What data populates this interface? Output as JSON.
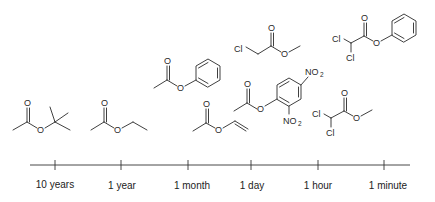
{
  "timeline": {
    "ticks": [
      {
        "label": "10 years",
        "x": 55
      },
      {
        "label": "1 year",
        "x": 121
      },
      {
        "label": "1 month",
        "x": 188
      },
      {
        "label": "1 day",
        "x": 251
      },
      {
        "label": "1 hour",
        "x": 318
      },
      {
        "label": "1 minute",
        "x": 384
      }
    ]
  },
  "molecules": [
    {
      "name": "tert-butyl acetate",
      "position": "10 years",
      "atoms": [
        "O",
        "O"
      ]
    },
    {
      "name": "ethyl acetate",
      "position": "1 year",
      "atoms": [
        "O",
        "O"
      ]
    },
    {
      "name": "phenyl acetate",
      "position": "1 month",
      "atoms": [
        "O",
        "O"
      ]
    },
    {
      "name": "vinyl acetate",
      "position": "1 month-1 day",
      "atoms": [
        "O",
        "O"
      ]
    },
    {
      "name": "methyl chloroacetate",
      "position": "1 day",
      "atoms": [
        "Cl",
        "O",
        "O"
      ]
    },
    {
      "name": "2,4-dinitrophenyl acetate",
      "position": "1 day",
      "atoms": [
        "O",
        "O",
        "NO2",
        "NO2"
      ]
    },
    {
      "name": "methyl dichloroacetate",
      "position": "1 hour",
      "atoms": [
        "Cl",
        "Cl",
        "O",
        "O"
      ]
    },
    {
      "name": "phenyl dichloroacetate",
      "position": "1 minute",
      "atoms": [
        "Cl",
        "Cl",
        "O",
        "O"
      ]
    }
  ],
  "labels": {
    "O": "O",
    "Cl": "Cl",
    "NO2_main": "NO",
    "NO2_sub": "2"
  }
}
